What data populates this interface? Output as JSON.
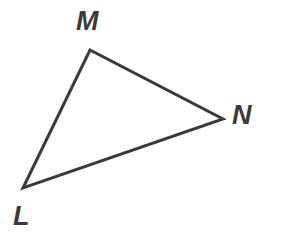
{
  "figure": {
    "name": "triangle-lmn",
    "type": "geometry-diagram",
    "background_color": "#ffffff",
    "stroke_color": "#3a3a3a",
    "stroke_width": 3,
    "width": 284,
    "height": 243,
    "shape": "triangle",
    "vertices": [
      {
        "id": "L",
        "label": "L",
        "x": 23,
        "y": 188,
        "label_x": 13,
        "label_y": 203
      },
      {
        "id": "M",
        "label": "M",
        "x": 90,
        "y": 50,
        "label_x": 76,
        "label_y": 8
      },
      {
        "id": "N",
        "label": "N",
        "x": 223,
        "y": 119,
        "label_x": 232,
        "label_y": 102
      }
    ],
    "edges": [
      {
        "id": "LM",
        "from": "L",
        "to": "M"
      },
      {
        "id": "MN",
        "from": "M",
        "to": "N"
      },
      {
        "id": "NL",
        "from": "N",
        "to": "L"
      }
    ],
    "path": "M 23 188 L 90 50 L 223 119 Z"
  }
}
